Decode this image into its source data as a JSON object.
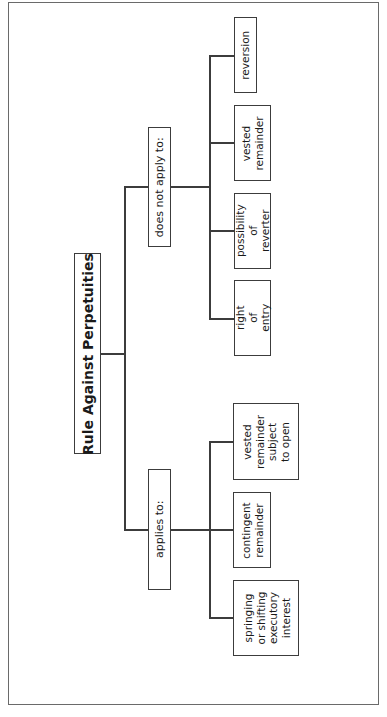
{
  "diagram": {
    "orientation": "rotated 90 degrees counter-clockwise",
    "root": {
      "label": "Rule Against Perpetuities"
    },
    "branches": [
      {
        "label": "does not apply to:",
        "children": [
          {
            "label": "reversion"
          },
          {
            "label": "vested\nremainder"
          },
          {
            "label": "possibility\nof reverter"
          },
          {
            "label": "right\nof entry"
          }
        ]
      },
      {
        "label": "applies to:",
        "children": [
          {
            "label": "vested\nremainder\nsubject\nto open"
          },
          {
            "label": "contingent\nremainder"
          },
          {
            "label": "springing\nor shifting\nexecutory\ninterest"
          }
        ]
      }
    ]
  }
}
